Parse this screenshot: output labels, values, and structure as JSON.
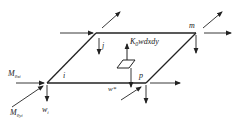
{
  "diagram": {
    "type": "plate-element-free-body-diagram",
    "nodes": {
      "i": {
        "label": "i"
      },
      "j": {
        "label": "j"
      },
      "m": {
        "label": "m"
      },
      "p": {
        "label": "p"
      }
    },
    "labels": {
      "foundation_force": {
        "main": "K",
        "sub": "0",
        "rest": "wdxdy"
      },
      "moment_x": {
        "main": "M",
        "sub": "θxi"
      },
      "moment_y": {
        "main": "M",
        "sub": "θyi"
      },
      "deflection_i": {
        "main": "w",
        "sub": "i"
      },
      "deflection_star": {
        "main": "w*"
      }
    },
    "colors": {
      "stroke": "#222222",
      "background": "#ffffff"
    }
  }
}
